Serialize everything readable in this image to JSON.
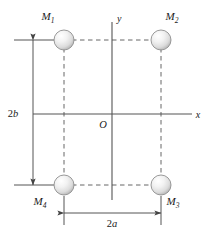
{
  "figure": {
    "background_color": "#ffffff",
    "line_color": "#555555",
    "text_color": "#1a1a1a",
    "width": 214,
    "height": 231
  },
  "axes": {
    "x_label": "x",
    "y_label": "y",
    "origin_label": "O",
    "x_axis": {
      "x1": 33,
      "y1": 114,
      "x2": 192,
      "y2": 114
    },
    "y_axis": {
      "x1": 112,
      "y1": 22,
      "x2": 112,
      "y2": 200
    }
  },
  "masses": [
    {
      "id": "M1",
      "label_base": "M",
      "label_sub": "1",
      "cx": 64,
      "cy": 40,
      "r": 10,
      "label_x": 48,
      "label_y": 20,
      "quadrant": "upper-left"
    },
    {
      "id": "M2",
      "label_base": "M",
      "label_sub": "2",
      "cx": 161,
      "cy": 40,
      "r": 10,
      "label_x": 172,
      "label_y": 20,
      "quadrant": "upper-right"
    },
    {
      "id": "M3",
      "label_base": "M",
      "label_sub": "3",
      "cx": 161,
      "cy": 185,
      "r": 10,
      "label_x": 173,
      "label_y": 205,
      "quadrant": "lower-right"
    },
    {
      "id": "M4",
      "label_base": "M",
      "label_sub": "4",
      "cx": 64,
      "cy": 185,
      "r": 10,
      "label_x": 40,
      "label_y": 205,
      "quadrant": "lower-left"
    }
  ],
  "dimensions": [
    {
      "id": "height",
      "label_number": "2",
      "label_var": "b",
      "orientation": "vertical",
      "line_x": 33,
      "line_y1": 40,
      "line_y2": 185,
      "label_x": 13,
      "label_y": 117,
      "extension_lines": [
        {
          "x1": 14,
          "y1": 40,
          "x2": 56,
          "y2": 40
        },
        {
          "x1": 14,
          "y1": 185,
          "x2": 56,
          "y2": 185
        }
      ]
    },
    {
      "id": "width",
      "label_number": "2",
      "label_var": "a",
      "orientation": "horizontal",
      "line_y": 213,
      "line_x1": 64,
      "line_x2": 161,
      "label_x": 112,
      "label_y": 227,
      "extension_lines": [
        {
          "x1": 64,
          "y1": 196,
          "x2": 64,
          "y2": 225
        },
        {
          "x1": 161,
          "y1": 196,
          "x2": 161,
          "y2": 225
        }
      ]
    }
  ],
  "dashed_connectors": [
    {
      "id": "top-edge",
      "x1": 64,
      "y1": 40,
      "x2": 161,
      "y2": 40
    },
    {
      "id": "bottom-edge",
      "x1": 64,
      "y1": 185,
      "x2": 161,
      "y2": 185
    },
    {
      "id": "left-edge",
      "x1": 64,
      "y1": 40,
      "x2": 64,
      "y2": 185
    },
    {
      "id": "right-edge",
      "x1": 161,
      "y1": 40,
      "x2": 161,
      "y2": 185
    }
  ]
}
